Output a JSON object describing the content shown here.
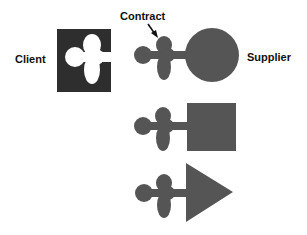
{
  "diagram": {
    "labels": {
      "client": "Client",
      "contract": "Contract",
      "supplier": "Supplier"
    },
    "colors": {
      "client_block": "#2e2e2e",
      "supplier_shape": "#555555",
      "background": "#ffffff",
      "text": "#111111"
    },
    "shapes": [
      {
        "id": "client",
        "type": "square-with-cutout"
      },
      {
        "id": "supplier-circle",
        "type": "plug-circle"
      },
      {
        "id": "supplier-square",
        "type": "plug-square"
      },
      {
        "id": "supplier-triangle",
        "type": "plug-triangle"
      }
    ]
  }
}
